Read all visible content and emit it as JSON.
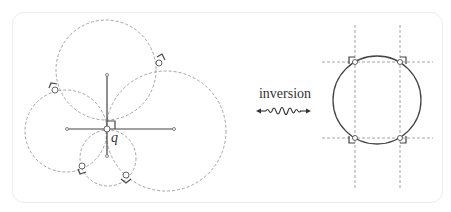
{
  "figure": {
    "left_panel": {
      "point_label": "q",
      "circles": [
        {
          "cx": 106,
          "cy": 70,
          "r": 50
        },
        {
          "cx": 166,
          "cy": 131,
          "r": 60
        },
        {
          "cx": 66,
          "cy": 131,
          "r": 41
        },
        {
          "cx": 108,
          "cy": 158,
          "r": 28
        }
      ]
    },
    "transform": {
      "label": "inversion",
      "arrow": "double-headed squiggle arrow"
    },
    "right_panel": {
      "circle": {
        "cx": 377,
        "cy": 100,
        "r": 44
      },
      "vertical_lines_x": [
        355,
        400
      ],
      "horizontal_lines_y": [
        62,
        138
      ]
    },
    "colors": {
      "solid_stroke": "#444444",
      "dashed_stroke": "#9a9a9a",
      "frame_border": "#ececec"
    }
  }
}
